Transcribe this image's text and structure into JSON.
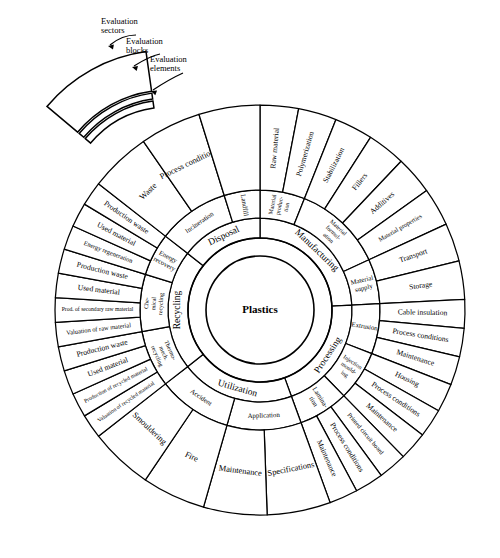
{
  "figure": {
    "center_label": "Plastics",
    "legend": {
      "sectors_label": "Evaluation\nsectors",
      "sectors_label_line1": "Evaluation",
      "sectors_label_line2": "sectors",
      "blocks_label_line1": "Evaluation",
      "blocks_label_line2": "blocks",
      "elements_label_line1": "Evaluation",
      "elements_label_line2": "elements"
    }
  },
  "chart_data": {
    "type": "pie",
    "center": "Plastics",
    "levels": [
      "Evaluation sectors",
      "Evaluation blocks",
      "Evaluation elements"
    ],
    "sectors": [
      {
        "name": "Manufacturing",
        "start_angle": -90,
        "end_angle": -3,
        "blocks": [
          {
            "name": "Material produc-\ntion",
            "name_lines": [
              "Material",
              "produc-",
              "tion"
            ],
            "elements": [
              "Raw material",
              "Polymerization"
            ]
          },
          {
            "name": "Material formul-\nation",
            "name_lines": [
              "Material",
              "formul-",
              "ation"
            ],
            "elements": [
              "Stabilization",
              "Fillers",
              "Additives",
              "Material properties"
            ]
          },
          {
            "name": "Material supply",
            "name_lines": [
              "Material",
              "supply"
            ],
            "elements": [
              "Transport",
              "Storage"
            ]
          }
        ]
      },
      {
        "name": "Processing",
        "start_angle": -3,
        "end_angle": 70,
        "blocks": [
          {
            "name": "Extrusion",
            "name_lines": [
              "Extrusion"
            ],
            "elements": [
              "Cable insulation",
              "Process conditions",
              "Maintenance"
            ]
          },
          {
            "name": "Injection mould-\ning",
            "name_lines": [
              "Injection",
              "mould-",
              "ing"
            ],
            "elements": [
              "Housing",
              "Process conditions",
              "Maintenance"
            ]
          },
          {
            "name": "Lamina-\ntion",
            "name_lines": [
              "Lamina-",
              "tion"
            ],
            "elements": [
              "Printed circuit board",
              "Process conditions",
              "Maintenance"
            ]
          }
        ]
      },
      {
        "name": "Utilization",
        "start_angle": 70,
        "end_angle": 142,
        "blocks": [
          {
            "name": "Application",
            "name_lines": [
              "Application"
            ],
            "elements": [
              "Specifications",
              "Maintenance"
            ]
          },
          {
            "name": "Accident",
            "name_lines": [
              "Accident"
            ],
            "elements": [
              "Fire",
              "Smouldering"
            ]
          }
        ]
      },
      {
        "name": "Recycling",
        "start_angle": 142,
        "end_angle": 218,
        "blocks": [
          {
            "name": "Thermo-\nmech.\nrecycling",
            "name_lines": [
              "Thermo-",
              "mech.",
              "recycling"
            ],
            "elements": [
              "Valuation of recycled material",
              "Production of recycled material",
              "Used material",
              "Production waste"
            ]
          },
          {
            "name": "Che-\nmical\nrecycling",
            "name_lines": [
              "Che-",
              "mical",
              "recycling"
            ],
            "elements": [
              "Valuation of raw material",
              "Prod. of secondary raw material",
              "Used material",
              "Production waste"
            ]
          },
          {
            "name": "Energy\nrecovery",
            "name_lines": [
              "Energy",
              "recovery"
            ],
            "elements": [
              "Energy regeneration",
              "Used material",
              "Production waste"
            ]
          }
        ]
      },
      {
        "name": "Disposal",
        "start_angle": 218,
        "end_angle": 270,
        "blocks": [
          {
            "name": "Incineration",
            "name_lines": [
              "Incineration"
            ],
            "elements": [
              "Waste",
              "Process conditions"
            ]
          },
          {
            "name": "Landfill",
            "name_lines": [
              "Landfill"
            ],
            "elements": [
              ""
            ]
          }
        ]
      }
    ],
    "geometry": {
      "cx": 260,
      "cy": 310,
      "r_center_inner": 54,
      "r_center_outer": 72,
      "r_sector_outer": 92,
      "r_block_outer": 120,
      "r_element_outer": 205
    }
  }
}
